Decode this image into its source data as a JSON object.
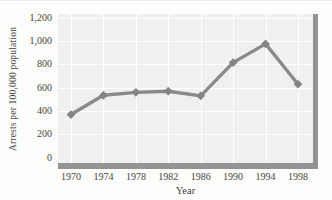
{
  "chart_data": {
    "type": "line",
    "title": "",
    "xlabel": "Year",
    "ylabel": "Arrests per 100,000 population",
    "categories": [
      "1970",
      "1974",
      "1978",
      "1982",
      "1986",
      "1990",
      "1994",
      "1998"
    ],
    "series": [
      {
        "name": "arrest-rate",
        "marker": "diamond",
        "values": [
          370,
          535,
          560,
          570,
          530,
          815,
          975,
          630
        ]
      }
    ],
    "ylim": [
      0,
      1200
    ],
    "ytick_step": 200,
    "ytick_labels": [
      "0",
      "200",
      "400",
      "600",
      "800",
      "1,000",
      "1,200"
    ],
    "grid": "both",
    "legend_position": "none",
    "colors": {
      "page_background": "#fdfdfb",
      "plot_background": "#f1f0ee",
      "gridline": "#ffffff",
      "axis_shadow": "#949392",
      "line": "#8a8a8a",
      "marker": "#848484",
      "text": "#454543"
    }
  }
}
